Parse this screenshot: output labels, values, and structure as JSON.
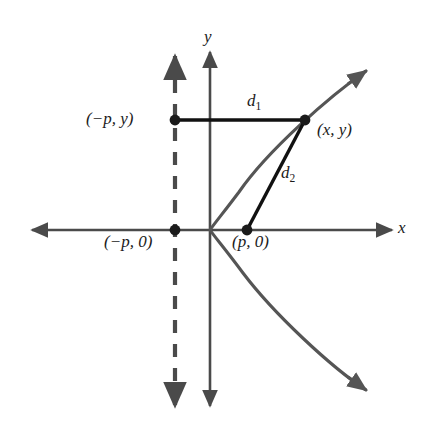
{
  "figure": {
    "background_color": "#ffffff",
    "axis_color": "#4a4a4a",
    "curve_color": "#555555",
    "segment_color": "#111111",
    "dash_color": "#4a4a4a",
    "point_color": "#1b1b1b"
  },
  "axes": {
    "x_label": "x",
    "y_label": "y",
    "origin": {
      "x": 210,
      "y": 230
    },
    "x_axis": {
      "x1": 32,
      "y1": 230,
      "x2": 392,
      "y2": 230,
      "arrows": "both"
    },
    "y_axis": {
      "x1": 210,
      "y1": 52,
      "x2": 210,
      "y2": 406,
      "arrows": "both"
    }
  },
  "directrix": {
    "name": "directrix",
    "style": "dashed",
    "x": 175,
    "y_top": 56,
    "y_bottom": 406,
    "arrows": "both"
  },
  "curve": {
    "type": "parabola",
    "orientation": "opens-right",
    "vertex": {
      "x": 210,
      "y": 230
    },
    "upper_arrow_tip": {
      "x": 366,
      "y": 71
    },
    "lower_arrow_tip": {
      "x": 366,
      "y": 390
    }
  },
  "points": [
    {
      "name": "directrix-point",
      "label": "(−p, y)",
      "x": 175,
      "y": 120
    },
    {
      "name": "curve-point",
      "label": "(x, y)",
      "x": 305,
      "y": 120
    },
    {
      "name": "directrix-foot",
      "label": "(−p, 0)",
      "x": 175,
      "y": 230
    },
    {
      "name": "focus",
      "label": "(p, 0)",
      "x": 247,
      "y": 230
    }
  ],
  "segments": [
    {
      "name": "d1",
      "label": "d",
      "subscript": "1",
      "from": {
        "x": 175,
        "y": 120
      },
      "to": {
        "x": 305,
        "y": 120
      }
    },
    {
      "name": "d2",
      "label": "d",
      "subscript": "2",
      "from": {
        "x": 247,
        "y": 230
      },
      "to": {
        "x": 305,
        "y": 120
      }
    }
  ]
}
